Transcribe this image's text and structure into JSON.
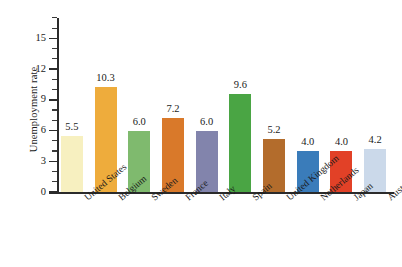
{
  "chart_data": {
    "type": "bar",
    "title": "",
    "subtitle": "",
    "xlabel": "",
    "ylabel": "Unemployment rate",
    "ylim": [
      0,
      17
    ],
    "y_ticks": [
      0,
      3,
      6,
      9,
      12,
      15
    ],
    "y_tick_labels": [
      "0",
      "3",
      "6",
      "9",
      "12",
      "15"
    ],
    "y_minor_tick_interval": 1,
    "grid": false,
    "legend": false,
    "legend_position": "none",
    "value_labels_shown": true,
    "x_label_rotation_deg": -40,
    "categories": [
      "United States",
      "Belgium",
      "Sweden",
      "France",
      "Italy",
      "Spain",
      "United Kingdom",
      "Netherlands",
      "Japan",
      "Australia"
    ],
    "values": [
      5.5,
      10.3,
      6.0,
      7.2,
      6.0,
      9.6,
      5.2,
      4.0,
      4.0,
      4.2
    ],
    "value_labels": [
      "5.5",
      "10.3",
      "6.0",
      "7.2",
      "6.0",
      "9.6",
      "5.2",
      "4.0",
      "4.0",
      "4.2"
    ],
    "bar_colors": [
      "#f7f0c0",
      "#eeac3c",
      "#7fba6e",
      "#d9792a",
      "#8284ac",
      "#4aa544",
      "#b36c2c",
      "#3a7cba",
      "#e24127",
      "#cbd9ea"
    ],
    "axis_color": "#2b2b2b",
    "background_color": "#ffffff",
    "text_color": "#1a1a1a"
  }
}
